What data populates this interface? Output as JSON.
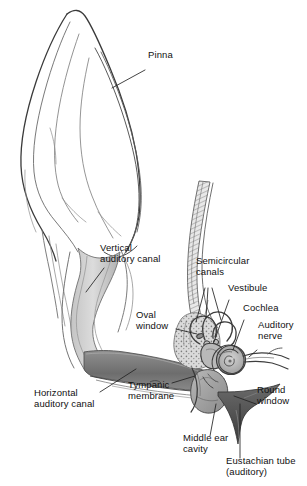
{
  "figure": {
    "width": 307,
    "height": 486,
    "background": "#ffffff"
  },
  "palette": {
    "outline": "#3a3a3a",
    "ink": "#111111",
    "canal_light": "#d6d6d6",
    "canal_mid": "#b5b5b5",
    "canal_dark": "#7a7a7a",
    "canal_darkest": "#5a5a5a",
    "bone_fill": "#c8c8c8",
    "cochlea_fill": "#a8a8a8",
    "leader_line": "#222222"
  },
  "labels": [
    {
      "id": "pinna",
      "text": "Pinna",
      "x": 148,
      "y": 55,
      "align": "left",
      "leader": {
        "x1": 145,
        "y1": 70,
        "x2": 112,
        "y2": 88
      }
    },
    {
      "id": "vertical-auditory-canal",
      "text": "Vertical\nauditory canal",
      "x": 100,
      "y": 243,
      "align": "left",
      "leader": {
        "x1": 104,
        "y1": 268,
        "x2": 86,
        "y2": 292
      }
    },
    {
      "id": "semicircular-canals",
      "text": "Semicircular\ncanals",
      "x": 196,
      "y": 262,
      "align": "left",
      "leader": {
        "x1": 205,
        "y1": 288,
        "x2": 198,
        "y2": 320
      }
    },
    {
      "id": "vestibule",
      "text": "Vestibule",
      "x": 228,
      "y": 288,
      "align": "left",
      "leader": {
        "x1": 229,
        "y1": 300,
        "x2": 214,
        "y2": 330
      }
    },
    {
      "id": "cochlea",
      "text": "Cochlea",
      "x": 243,
      "y": 308,
      "align": "left",
      "leader": {
        "x1": 244,
        "y1": 320,
        "x2": 232,
        "y2": 348
      }
    },
    {
      "id": "auditory-nerve",
      "text": "Auditory\nnerve",
      "x": 258,
      "y": 325,
      "align": "left",
      "leader": {
        "x1": 257,
        "y1": 350,
        "x2": 247,
        "y2": 356
      }
    },
    {
      "id": "oval-window",
      "text": "Oval\nwindow",
      "x": 136,
      "y": 314,
      "align": "left",
      "leader": {
        "x1": 176,
        "y1": 329,
        "x2": 196,
        "y2": 333
      }
    },
    {
      "id": "horizontal-auditory-canal",
      "text": "Horizontal\nauditory canal",
      "x": 34,
      "y": 393,
      "align": "left",
      "leader": {
        "x1": 100,
        "y1": 392,
        "x2": 133,
        "y2": 372
      }
    },
    {
      "id": "tympanic-membrane",
      "text": "Tympanic\nmembrane",
      "x": 128,
      "y": 385,
      "align": "left",
      "leader": {
        "x1": 170,
        "y1": 385,
        "x2": 196,
        "y2": 375
      }
    },
    {
      "id": "middle-ear-cavity",
      "text": "Middle ear\ncavity",
      "x": 183,
      "y": 438,
      "align": "left",
      "leader": {
        "x1": 210,
        "y1": 436,
        "x2": 218,
        "y2": 404
      }
    },
    {
      "id": "round-window",
      "text": "Round\nwindow",
      "x": 257,
      "y": 390,
      "align": "left",
      "leader": {
        "x1": 256,
        "y1": 404,
        "x2": 232,
        "y2": 396
      }
    },
    {
      "id": "eustachian-tube",
      "text": "Eustachian tube\n(auditory)",
      "x": 226,
      "y": 461,
      "align": "left",
      "leader": {
        "x1": 240,
        "y1": 458,
        "x2": 240,
        "y2": 404
      }
    }
  ],
  "parts": [
    {
      "id": "pinna",
      "name": "pinna",
      "region": "outer-ear"
    },
    {
      "id": "vertical-auditory-canal",
      "name": "vertical auditory canal",
      "region": "outer-ear"
    },
    {
      "id": "horizontal-auditory-canal",
      "name": "horizontal auditory canal",
      "region": "outer-ear"
    },
    {
      "id": "tympanic-membrane",
      "name": "tympanic membrane",
      "region": "middle-ear"
    },
    {
      "id": "middle-ear-cavity",
      "name": "middle ear cavity",
      "region": "middle-ear"
    },
    {
      "id": "oval-window",
      "name": "oval window",
      "region": "middle-ear"
    },
    {
      "id": "round-window",
      "name": "round window",
      "region": "middle-ear"
    },
    {
      "id": "eustachian-tube",
      "name": "Eustachian tube (auditory)",
      "region": "middle-ear"
    },
    {
      "id": "semicircular-canals",
      "name": "semicircular canals",
      "region": "inner-ear"
    },
    {
      "id": "vestibule",
      "name": "vestibule",
      "region": "inner-ear"
    },
    {
      "id": "cochlea",
      "name": "cochlea",
      "region": "inner-ear"
    },
    {
      "id": "auditory-nerve",
      "name": "auditory nerve",
      "region": "inner-ear"
    }
  ]
}
